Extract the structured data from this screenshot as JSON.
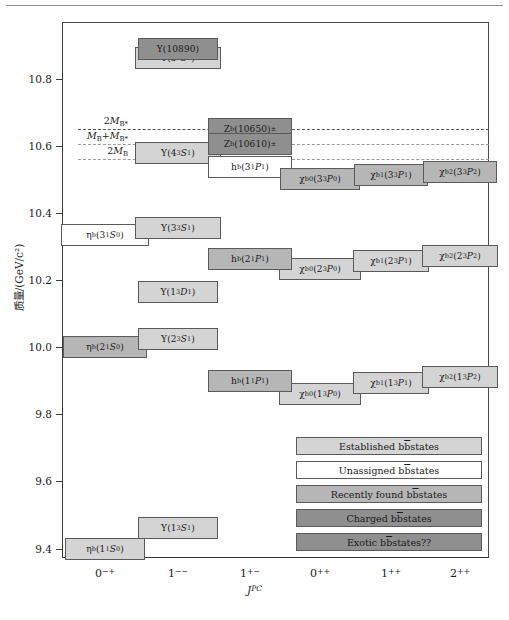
{
  "figure": {
    "type": "energy-level-diagram"
  },
  "axes": {
    "y_label": "质量/(GeV/c²)",
    "x_label": "J",
    "x_label_sup": "PC",
    "y_ticks": [
      "10.8",
      "10.6",
      "10.4",
      "10.2",
      "10.0",
      "9.8",
      "9.6",
      "9.4"
    ],
    "y_tick_values": [
      10.8,
      10.6,
      10.4,
      10.2,
      10.0,
      9.8,
      9.6,
      9.4
    ],
    "y_range": [
      9.33,
      10.98
    ],
    "x_ticks": [
      "0−+",
      "1−−",
      "1+−",
      "0++",
      "1++",
      "2++"
    ],
    "x_tick_main": [
      "0",
      "1",
      "1",
      "0",
      "1",
      "2"
    ],
    "x_tick_sup": [
      "−+",
      "−−",
      "+−",
      "++",
      "++",
      "++"
    ]
  },
  "thresholds": [
    {
      "label_main": "2M",
      "label_sub": "B*",
      "value": 10.65,
      "style": "dark"
    },
    {
      "label_main": "M",
      "label_sub1": "B",
      "label_mid": "+M",
      "label_sub2": "B*",
      "value": 10.605,
      "style": "light"
    },
    {
      "label_main": "2M",
      "label_sub": "B",
      "value": 10.56,
      "style": "light"
    }
  ],
  "chart_data": {
    "type": "level-diagram",
    "title": "",
    "xlabel": "J^PC",
    "ylabel": "质量/(GeV/c²)",
    "ylim": [
      9.33,
      10.98
    ],
    "columns": [
      "0-+",
      "1--",
      "1+-",
      "0++",
      "1++",
      "2++"
    ],
    "legend": [
      {
        "key": "est",
        "label": "Established bb̅ states",
        "color": "#d4d4d4"
      },
      {
        "key": "una",
        "label": "Unassigned bb̅ states",
        "color": "#ffffff"
      },
      {
        "key": "rec",
        "label": "Recently found bb̅ states",
        "color": "#b6b6b6"
      },
      {
        "key": "chg",
        "label": "Charged bb̅ states",
        "color": "#8f8f8f"
      },
      {
        "key": "exo",
        "label": "Exotic bb̅ states??",
        "color": "#8f8f8f"
      }
    ],
    "states": [
      {
        "name": "Υ(10890)",
        "mass": 10.89,
        "column": "1--",
        "kind": "exo"
      },
      {
        "name": "Υ(5³S₁)",
        "mass": 10.865,
        "column": "1--",
        "kind": "est"
      },
      {
        "name": "Z_b(10650)±",
        "mass": 10.652,
        "column": "1+-",
        "kind": "chg"
      },
      {
        "name": "Z_b(10610)±",
        "mass": 10.607,
        "column": "1+-",
        "kind": "chg"
      },
      {
        "name": "Υ(4³S₁)",
        "mass": 10.579,
        "column": "1--",
        "kind": "est"
      },
      {
        "name": "h_b(3¹P₁)",
        "mass": 10.54,
        "column": "1+-",
        "kind": "una"
      },
      {
        "name": "χ_b0(3³P₀)",
        "mass": 10.5,
        "column": "0++",
        "kind": "rec"
      },
      {
        "name": "χ_b1(3³P₁)",
        "mass": 10.512,
        "column": "1++",
        "kind": "rec"
      },
      {
        "name": "χ_b2(3³P₂)",
        "mass": 10.522,
        "column": "2++",
        "kind": "rec"
      },
      {
        "name": "Υ(3³S₁)",
        "mass": 10.355,
        "column": "1--",
        "kind": "est"
      },
      {
        "name": "η_b(3¹S₀)",
        "mass": 10.335,
        "column": "0-+",
        "kind": "una"
      },
      {
        "name": "h_b(2¹P₁)",
        "mass": 10.26,
        "column": "1+-",
        "kind": "rec"
      },
      {
        "name": "χ_b0(2³P₀)",
        "mass": 10.232,
        "column": "0++",
        "kind": "est"
      },
      {
        "name": "χ_b1(2³P₁)",
        "mass": 10.255,
        "column": "1++",
        "kind": "est"
      },
      {
        "name": "χ_b2(2³P₂)",
        "mass": 10.269,
        "column": "2++",
        "kind": "est"
      },
      {
        "name": "Υ(1³D₁)",
        "mass": 10.164,
        "column": "1--",
        "kind": "est"
      },
      {
        "name": "Υ(2³S₁)",
        "mass": 10.023,
        "column": "1--",
        "kind": "est"
      },
      {
        "name": "η_b(2¹S₀)",
        "mass": 9.999,
        "column": "0-+",
        "kind": "rec"
      },
      {
        "name": "h_b(1¹P₁)",
        "mass": 9.899,
        "column": "1+-",
        "kind": "rec"
      },
      {
        "name": "χ_b0(1³P₀)",
        "mass": 9.859,
        "column": "0++",
        "kind": "est"
      },
      {
        "name": "χ_b1(1³P₁)",
        "mass": 9.893,
        "column": "1++",
        "kind": "est"
      },
      {
        "name": "χ_b2(1³P₂)",
        "mass": 9.912,
        "column": "2++",
        "kind": "est"
      },
      {
        "name": "Υ(1³S₁)",
        "mass": 9.46,
        "column": "1--",
        "kind": "est"
      },
      {
        "name": "η_b(1¹S₀)",
        "mass": 9.399,
        "column": "0-+",
        "kind": "est"
      }
    ]
  },
  "states_html": {
    "ups10890": "Υ(10890)",
    "ups5s": "Υ(5<sup>3</sup><i>S</i><sub>1</sub>)",
    "zb10650": "Z<sub>b</sub>(10650)<sup>±</sup>",
    "zb10610": "Z<sub>b</sub>(10610)<sup>±</sup>",
    "ups4s": "Υ(4<sup>3</sup><i>S</i><sub>1</sub>)",
    "hb3p": "h<sub>b</sub>(3<sup>1</sup><i>P</i><sub>1</sub>)",
    "chib03p": "χ<sub>b0</sub>(3<sup>3</sup><i>P</i><sub>0</sub>)",
    "chib13p": "χ<sub>b1</sub>(3<sup>3</sup><i>P</i><sub>1</sub>)",
    "chib23p": "χ<sub>b2</sub>(3<sup>3</sup><i>P</i><sub>2</sub>)",
    "ups3s": "Υ(3<sup>3</sup><i>S</i><sub>1</sub>)",
    "etab3s": "η<sub>b</sub>(3<sup>1</sup><i>S</i><sub>0</sub>)",
    "hb2p": "h<sub>b</sub>(2<sup>1</sup><i>P</i><sub>1</sub>)",
    "chib02p": "χ<sub>b0</sub>(2<sup>3</sup><i>P</i><sub>0</sub>)",
    "chib12p": "χ<sub>b1</sub>(2<sup>3</sup><i>P</i><sub>1</sub>)",
    "chib22p": "χ<sub>b2</sub>(2<sup>3</sup><i>P</i><sub>2</sub>)",
    "ups1d": "Υ(1<sup>3</sup><i>D</i><sub>1</sub>)",
    "ups2s": "Υ(2<sup>3</sup><i>S</i><sub>1</sub>)",
    "etab2s": "η<sub>b</sub>(2<sup>1</sup><i>S</i><sub>0</sub>)",
    "hb1p": "h<sub>b</sub>(1<sup>1</sup><i>P</i><sub>1</sub>)",
    "chib01p": "χ<sub>b0</sub>(1<sup>3</sup><i>P</i><sub>0</sub>)",
    "chib11p": "χ<sub>b1</sub>(1<sup>3</sup><i>P</i><sub>1</sub>)",
    "chib21p": "χ<sub>b2</sub>(1<sup>3</sup><i>P</i><sub>2</sub>)",
    "ups1s": "Υ(1<sup>3</sup><i>S</i><sub>1</sub>)",
    "etab1s": "η<sub>b</sub>(1<sup>1</sup><i>S</i><sub>0</sub>)"
  },
  "threshold_html": {
    "t1": "2<i>M</i><sub>B*</sub>",
    "t2": "<i>M</i><sub>B</sub>+<i>M</i><sub>B*</sub>",
    "t3": "2<i>M</i><sub>B</sub>"
  },
  "legend_html": {
    "l1": "Established b<span style='text-decoration:overline'>b</span> states",
    "l2": "Unassigned b<span style='text-decoration:overline'>b</span> states",
    "l3": "Recently found b<span style='text-decoration:overline'>b</span> states",
    "l4": "Charged b<span style='text-decoration:overline'>b</span> states",
    "l5": "Exotic b<span style='text-decoration:overline'>b</span> states??"
  }
}
